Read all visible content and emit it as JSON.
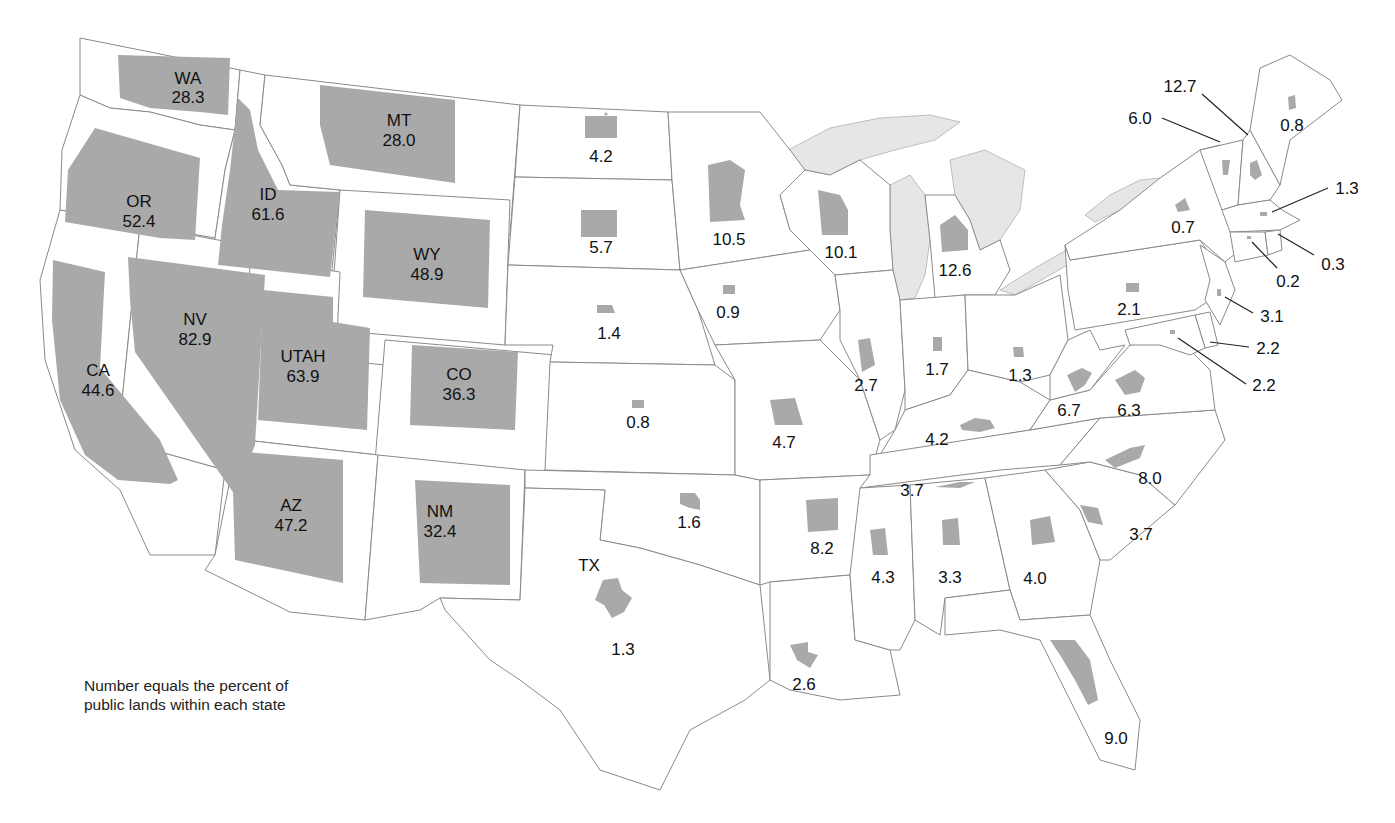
{
  "map": {
    "title": "Percent of public lands within each state",
    "note_line1": "Number equals the percent of",
    "note_line2": "public lands within each state",
    "colors": {
      "public_land_fill": "#a9a9a9",
      "state_fill": "#ffffff",
      "border": "#8a8a8a",
      "lake_fill": "#e6e6e6"
    }
  },
  "states": {
    "WA": {
      "abbr": "WA",
      "value": "28.3"
    },
    "OR": {
      "abbr": "OR",
      "value": "52.4"
    },
    "CA": {
      "abbr": "CA",
      "value": "44.6"
    },
    "ID": {
      "abbr": "ID",
      "value": "61.6"
    },
    "NV": {
      "abbr": "NV",
      "value": "82.9"
    },
    "MT": {
      "abbr": "MT",
      "value": "28.0"
    },
    "WY": {
      "abbr": "WY",
      "value": "48.9"
    },
    "UT": {
      "abbr": "UTAH",
      "value": "63.9"
    },
    "CO": {
      "abbr": "CO",
      "value": "36.3"
    },
    "AZ": {
      "abbr": "AZ",
      "value": "47.2"
    },
    "NM": {
      "abbr": "NM",
      "value": "32.4"
    },
    "ND": {
      "value": "4.2"
    },
    "SD": {
      "value": "5.7"
    },
    "NE": {
      "value": "1.4"
    },
    "KS": {
      "value": "0.8"
    },
    "OK": {
      "value": "1.6"
    },
    "TX": {
      "abbr": "TX",
      "value": "1.3"
    },
    "MN": {
      "value": "10.5"
    },
    "IA": {
      "value": "0.9"
    },
    "MO": {
      "value": "4.7"
    },
    "AR": {
      "value": "8.2"
    },
    "LA": {
      "value": "2.6"
    },
    "WI": {
      "value": "10.1"
    },
    "IL": {
      "value": "2.7"
    },
    "MI": {
      "value": "12.6"
    },
    "IN": {
      "value": "1.7"
    },
    "OH": {
      "value": "1.3"
    },
    "KY": {
      "value": "4.2"
    },
    "TN": {
      "value": "3.7"
    },
    "MS": {
      "value": "4.3"
    },
    "AL": {
      "value": "3.3"
    },
    "GA": {
      "value": "4.0"
    },
    "FL": {
      "value": "9.0"
    },
    "SC": {
      "value": "3.7"
    },
    "NC": {
      "value": "8.0"
    },
    "VA": {
      "value": "6.3"
    },
    "WV": {
      "value": "6.7"
    },
    "PA": {
      "value": "2.1"
    },
    "NY": {
      "value": "0.7"
    },
    "ME": {
      "value": "0.8"
    },
    "NH": {
      "value": "12.7"
    },
    "VT": {
      "value": "6.0"
    },
    "MA": {
      "value": "1.3"
    },
    "RI": {
      "value": "0.3"
    },
    "CT": {
      "value": "0.2"
    },
    "NJ": {
      "value": "3.1"
    },
    "DE": {
      "value": "2.2"
    },
    "MD": {
      "value": "2.2"
    }
  }
}
